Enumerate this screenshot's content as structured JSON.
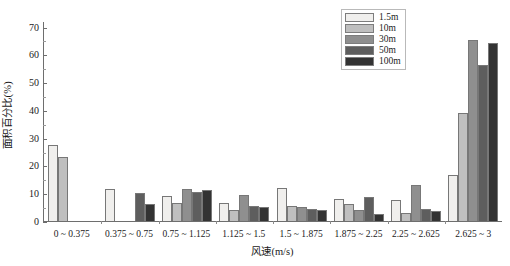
{
  "chart_data": {
    "type": "bar",
    "title": "",
    "xlabel": "风速(m/s)",
    "ylabel": "面积百分比(%)",
    "ylim": [
      0,
      72
    ],
    "yticks": [
      0,
      10,
      20,
      30,
      40,
      50,
      60,
      70
    ],
    "ytick_labels": [
      "0",
      "10",
      "20",
      "30",
      "40",
      "50",
      "60",
      "70"
    ],
    "yminor_ticks": [
      5,
      15,
      25,
      35,
      45,
      55,
      65
    ],
    "grid": false,
    "legend_position": "top-right",
    "categories": [
      "0 ~ 0.375",
      "0.375 ~ 0.75",
      "0.75 ~ 1.125",
      "1.125 ~ 1.5",
      "1.5 ~ 1.875",
      "1.875 ~ 2.25",
      "2.25 ~ 2.625",
      "2.625 ~ 3"
    ],
    "series": [
      {
        "name": "1.5m",
        "color": "#f0efed",
        "values": [
          27.5,
          11.5,
          9.0,
          6.5,
          12.0,
          8.0,
          7.5,
          16.5
        ]
      },
      {
        "name": "10m",
        "color": "#bfbfbf",
        "values": [
          23.0,
          0,
          6.5,
          4.0,
          5.5,
          6.0,
          3.0,
          39.0
        ]
      },
      {
        "name": "30m",
        "color": "#8f8f8f",
        "values": [
          0,
          0,
          11.5,
          9.5,
          5.0,
          4.0,
          13.0,
          65.0
        ]
      },
      {
        "name": "50m",
        "color": "#5e5e5e",
        "values": [
          0,
          10.0,
          10.5,
          5.5,
          4.5,
          8.5,
          4.5,
          56.0
        ]
      },
      {
        "name": "100m",
        "color": "#333333",
        "values": [
          0,
          6.0,
          11.0,
          5.0,
          4.0,
          2.5,
          3.5,
          64.0
        ]
      }
    ]
  }
}
